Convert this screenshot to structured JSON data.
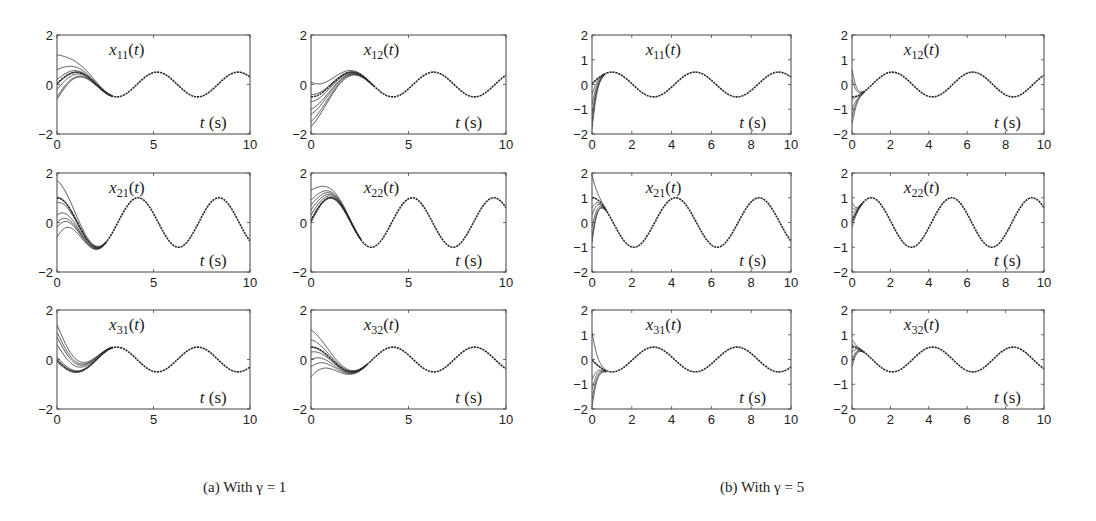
{
  "figure": {
    "captions": [
      {
        "id": "a",
        "text": "(a) With γ = 1",
        "x": 203
      },
      {
        "id": "b",
        "text": "(b) With γ = 5",
        "x": 720
      }
    ],
    "line_color": "#2a2a2a",
    "axis_color": "#444444"
  },
  "chart_data": [
    {
      "group": "a",
      "type": "line",
      "title": "x11(t)",
      "label_main": "x",
      "label_sub": "11",
      "xlabel": "t (s)",
      "ylabel": "",
      "xlim": [
        0,
        10
      ],
      "ylim": [
        -2,
        2
      ],
      "xticks": [
        0,
        5,
        10
      ],
      "yticks": [
        -2,
        0,
        2
      ],
      "box": {
        "left": 57,
        "top": 35,
        "right": 250,
        "bottom": 134
      },
      "steady": {
        "amplitude": 0.5,
        "omega": 1.5,
        "peak_t": 1.0
      },
      "initial_values": [
        1.2,
        0.6,
        0.2,
        0.0,
        -0.2,
        -0.5,
        -0.6
      ],
      "settle_time": 1.8
    },
    {
      "group": "a",
      "type": "line",
      "title": "x12(t)",
      "label_main": "x",
      "label_sub": "12",
      "xlabel": "t (s)",
      "ylabel": "",
      "xlim": [
        0,
        10
      ],
      "ylim": [
        -2,
        2
      ],
      "xticks": [
        0,
        5,
        10
      ],
      "yticks": [
        -2,
        0,
        2
      ],
      "box": {
        "left": 311,
        "top": 35,
        "right": 506,
        "bottom": 134
      },
      "steady": {
        "amplitude": 0.5,
        "omega": 1.5,
        "peak_t": 2.1
      },
      "initial_values": [
        0.1,
        -0.4,
        -0.7,
        -1.0,
        -1.2,
        -1.5,
        -1.7
      ],
      "settle_time": 2.0
    },
    {
      "group": "a",
      "type": "line",
      "title": "x21(t)",
      "label_main": "x",
      "label_sub": "21",
      "xlabel": "t (s)",
      "ylabel": "",
      "xlim": [
        0,
        10
      ],
      "ylim": [
        -2,
        2
      ],
      "xticks": [
        0,
        5,
        10
      ],
      "yticks": [
        -2,
        0,
        2
      ],
      "box": {
        "left": 57,
        "top": 173,
        "right": 250,
        "bottom": 272
      },
      "steady": {
        "amplitude": 1.0,
        "omega": 1.5,
        "peak_t": 4.2
      },
      "initial_values": [
        1.7,
        1.0,
        0.8,
        0.3,
        0.0,
        -0.2,
        -0.6
      ],
      "settle_time": 1.6
    },
    {
      "group": "a",
      "type": "line",
      "title": "x22(t)",
      "label_main": "x",
      "label_sub": "22",
      "xlabel": "t (s)",
      "ylabel": "",
      "xlim": [
        0,
        10
      ],
      "ylim": [
        -2,
        2
      ],
      "xticks": [
        0,
        5,
        10
      ],
      "yticks": [
        -2,
        0,
        2
      ],
      "box": {
        "left": 311,
        "top": 173,
        "right": 506,
        "bottom": 272
      },
      "steady": {
        "amplitude": 1.0,
        "omega": 1.5,
        "peak_t": 1.0
      },
      "initial_values": [
        1.3,
        0.9,
        0.7,
        0.5,
        0.3,
        0.1,
        0.0
      ],
      "settle_time": 1.6
    },
    {
      "group": "a",
      "type": "line",
      "title": "x31(t)",
      "label_main": "x",
      "label_sub": "31",
      "xlabel": "t (s)",
      "ylabel": "",
      "xlim": [
        0,
        10
      ],
      "ylim": [
        -2,
        2
      ],
      "xticks": [
        0,
        5,
        10
      ],
      "yticks": [
        -2,
        0,
        2
      ],
      "box": {
        "left": 57,
        "top": 310,
        "right": 250,
        "bottom": 409
      },
      "steady": {
        "amplitude": 0.5,
        "omega": 1.5,
        "peak_t": 3.1
      },
      "initial_values": [
        1.4,
        1.1,
        0.9,
        0.6,
        0.1,
        0.0,
        -0.1
      ],
      "settle_time": 1.8
    },
    {
      "group": "a",
      "type": "line",
      "title": "x32(t)",
      "label_main": "x",
      "label_sub": "32",
      "xlabel": "t (s)",
      "ylabel": "",
      "xlim": [
        0,
        10
      ],
      "ylim": [
        -2,
        2
      ],
      "xticks": [
        0,
        5,
        10
      ],
      "yticks": [
        -2,
        0,
        2
      ],
      "box": {
        "left": 311,
        "top": 310,
        "right": 506,
        "bottom": 409
      },
      "steady": {
        "amplitude": 0.5,
        "omega": 1.5,
        "peak_t": 4.2
      },
      "initial_values": [
        1.2,
        0.8,
        0.5,
        0.3,
        0.0,
        -0.3,
        -0.7
      ],
      "settle_time": 1.8
    },
    {
      "group": "b",
      "type": "line",
      "title": "x11(t)",
      "label_main": "x",
      "label_sub": "11",
      "xlabel": "t (s)",
      "ylabel": "",
      "xlim": [
        0,
        10
      ],
      "ylim": [
        -2,
        2
      ],
      "xticks": [
        0,
        2,
        4,
        6,
        8,
        10
      ],
      "yticks": [
        -2,
        -1,
        0,
        1,
        2
      ],
      "box": {
        "left": 592,
        "top": 35,
        "right": 791,
        "bottom": 134
      },
      "steady": {
        "amplitude": 0.5,
        "omega": 1.5,
        "peak_t": 1.0
      },
      "initial_values": [
        0.0,
        -0.4,
        -0.8,
        -1.2,
        -1.5,
        -1.8
      ],
      "settle_time": 0.4
    },
    {
      "group": "b",
      "type": "line",
      "title": "x12(t)",
      "label_main": "x",
      "label_sub": "12",
      "xlabel": "t (s)",
      "ylabel": "",
      "xlim": [
        0,
        10
      ],
      "ylim": [
        -2,
        2
      ],
      "xticks": [
        0,
        2,
        4,
        6,
        8,
        10
      ],
      "yticks": [
        -2,
        -1,
        0,
        1,
        2
      ],
      "box": {
        "left": 852,
        "top": 35,
        "right": 1044,
        "bottom": 134
      },
      "steady": {
        "amplitude": 0.5,
        "omega": 1.5,
        "peak_t": 2.1
      },
      "initial_values": [
        0.6,
        0.2,
        -0.6,
        -1.0,
        -1.3,
        -1.6
      ],
      "settle_time": 0.4
    },
    {
      "group": "b",
      "type": "line",
      "title": "x21(t)",
      "label_main": "x",
      "label_sub": "21",
      "xlabel": "t (s)",
      "ylabel": "",
      "xlim": [
        0,
        10
      ],
      "ylim": [
        -2,
        2
      ],
      "xticks": [
        0,
        2,
        4,
        6,
        8,
        10
      ],
      "yticks": [
        -2,
        -1,
        0,
        1,
        2
      ],
      "box": {
        "left": 592,
        "top": 173,
        "right": 791,
        "bottom": 272
      },
      "steady": {
        "amplitude": 1.0,
        "omega": 1.5,
        "peak_t": 4.2
      },
      "initial_values": [
        1.9,
        0.6,
        0.3,
        -0.2,
        -0.6,
        -0.8
      ],
      "settle_time": 0.45
    },
    {
      "group": "b",
      "type": "line",
      "title": "x22(t)",
      "label_main": "x",
      "label_sub": "22",
      "xlabel": "t (s)",
      "ylabel": "",
      "xlim": [
        0,
        10
      ],
      "ylim": [
        -2,
        2
      ],
      "xticks": [
        0,
        2,
        4,
        6,
        8,
        10
      ],
      "yticks": [
        -2,
        -1,
        0,
        1,
        2
      ],
      "box": {
        "left": 852,
        "top": 173,
        "right": 1044,
        "bottom": 272
      },
      "steady": {
        "amplitude": 1.0,
        "omega": 1.5,
        "peak_t": 1.0
      },
      "initial_values": [
        0.8,
        0.6,
        0.4,
        0.2,
        0.0,
        -0.2
      ],
      "settle_time": 0.35
    },
    {
      "group": "b",
      "type": "line",
      "title": "x31(t)",
      "label_main": "x",
      "label_sub": "31",
      "xlabel": "t (s)",
      "ylabel": "",
      "xlim": [
        0,
        10
      ],
      "ylim": [
        -2,
        2
      ],
      "xticks": [
        0,
        2,
        4,
        6,
        8,
        10
      ],
      "yticks": [
        -2,
        -1,
        0,
        1,
        2
      ],
      "box": {
        "left": 592,
        "top": 310,
        "right": 791,
        "bottom": 409
      },
      "steady": {
        "amplitude": 0.5,
        "omega": 1.5,
        "peak_t": 3.1
      },
      "initial_values": [
        1.1,
        0.0,
        -0.8,
        -1.2,
        -1.6,
        -1.9
      ],
      "settle_time": 0.45
    },
    {
      "group": "b",
      "type": "line",
      "title": "x32(t)",
      "label_main": "x",
      "label_sub": "32",
      "xlabel": "t (s)",
      "ylabel": "",
      "xlim": [
        0,
        10
      ],
      "ylim": [
        -2,
        2
      ],
      "xticks": [
        0,
        2,
        4,
        6,
        8,
        10
      ],
      "yticks": [
        -2,
        -1,
        0,
        1,
        2
      ],
      "box": {
        "left": 852,
        "top": 310,
        "right": 1044,
        "bottom": 409
      },
      "steady": {
        "amplitude": 0.5,
        "omega": 1.5,
        "peak_t": 4.2
      },
      "initial_values": [
        0.8,
        0.6,
        0.3,
        0.0,
        -0.1,
        -0.3
      ],
      "settle_time": 0.4
    }
  ]
}
